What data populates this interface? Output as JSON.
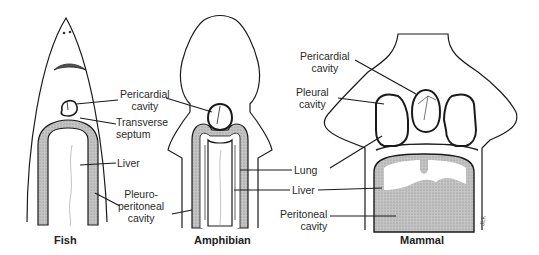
{
  "figure": {
    "panels": [
      {
        "id": "fish",
        "caption": "Fish"
      },
      {
        "id": "amphibian",
        "caption": "Amphibian"
      },
      {
        "id": "mammal",
        "caption": "Mammal"
      }
    ],
    "labels": {
      "fish_pericardial_1": "Pericardial",
      "fish_pericardial_2": "cavity",
      "transverse_1": "Transverse",
      "transverse_2": "septum",
      "fish_liver": "Liver",
      "pleuro_1": "Pleuro-",
      "pleuro_2": "peritoneal",
      "pleuro_3": "cavity",
      "mammal_pericardial_1": "Pericardial",
      "mammal_pericardial_2": "cavity",
      "pleural_1": "Pleural",
      "pleural_2": "cavity",
      "lung": "Lung",
      "liver": "Liver",
      "peritoneal_1": "Peritoneal",
      "peritoneal_2": "cavity"
    },
    "signature": "JLK",
    "colors": {
      "line": "#1a1a1a",
      "shade": "#b9b9b9",
      "dark_shade": "#6a6a6a",
      "background": "#ffffff"
    }
  }
}
